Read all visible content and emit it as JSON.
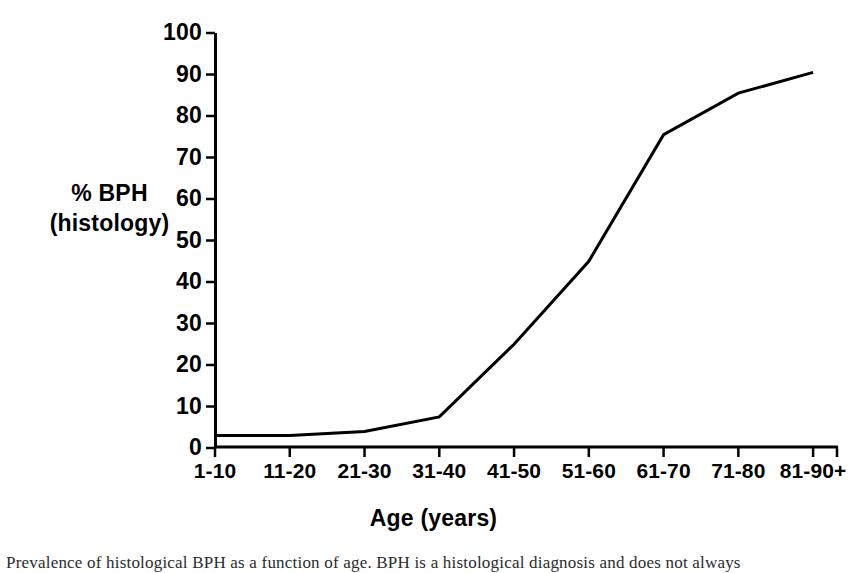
{
  "chart_data": {
    "type": "line",
    "title": "",
    "subtitle": "",
    "xlabel": "Age (years)",
    "ylabel_lines": [
      "% BPH",
      "(histology)"
    ],
    "ylabel": "% BPH (histology)",
    "categories": [
      "1-10",
      "11-20",
      "21-30",
      "31-40",
      "41-50",
      "51-60",
      "61-70",
      "71-80",
      "81-90+"
    ],
    "values": [
      3,
      3,
      4,
      7.5,
      25,
      45,
      75.5,
      85.5,
      90.5
    ],
    "series": [
      {
        "name": "% BPH (histology)",
        "values": [
          3,
          3,
          4,
          7.5,
          25,
          45,
          75.5,
          85.5,
          90.5
        ]
      }
    ],
    "ylim": [
      0,
      100
    ],
    "ytick_values": [
      0,
      10,
      20,
      30,
      40,
      50,
      60,
      70,
      80,
      90,
      100
    ],
    "ytick_labels": [
      "0",
      "10",
      "20",
      "30",
      "40",
      "50",
      "60",
      "70",
      "80",
      "90",
      "100"
    ],
    "grid": false,
    "legend": false,
    "legend_position": "none",
    "line_color": "#000000",
    "line_width": 3,
    "markers": false,
    "axis_color": "#000000"
  },
  "caption": {
    "text": "Prevalence of histological BPH as a function of age. BPH is a histological diagnosis and does not always"
  }
}
